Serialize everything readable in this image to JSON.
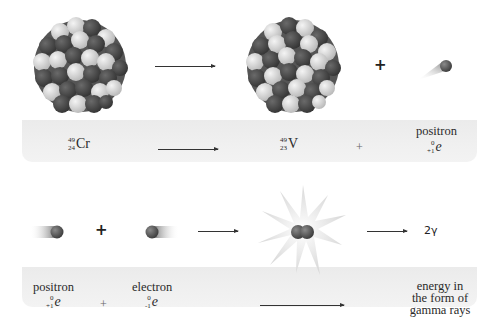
{
  "diagram": {
    "type": "nuclear reaction illustration",
    "rows": [
      {
        "id": "positron-emission",
        "illustration": {
          "reactant": "chromium-49 nucleus (cluster of light and dark nucleons)",
          "arrow": "right-arrow",
          "product": "vanadium-49 nucleus (cluster of light and dark nucleons)",
          "operator": "+",
          "emitted": "positron particle with motion trail"
        },
        "equation": {
          "reactant": {
            "mass": "49",
            "atomic": "24",
            "symbol": "Cr"
          },
          "arrow": "right-arrow",
          "product": {
            "mass": "49",
            "atomic": "23",
            "symbol": "V"
          },
          "operator": "+",
          "particle": {
            "name": "positron",
            "mass": "0",
            "charge": "+1",
            "symbol": "e"
          }
        }
      },
      {
        "id": "annihilation",
        "illustration": {
          "particle1": "positron with motion trail",
          "operator": "+",
          "particle2": "electron with motion trail",
          "arrow": "right-arrow",
          "event": "annihilation burst (12-point star with two particles)",
          "arrow2": "right-arrow",
          "result": "2γ"
        },
        "equation": {
          "particle1": {
            "name": "positron",
            "mass": "0",
            "charge": "+1",
            "symbol": "e"
          },
          "operator": "+",
          "particle2": {
            "name": "electron",
            "mass": "0",
            "charge": "-1",
            "symbol": "e"
          },
          "arrow": "right-arrow",
          "result_lines": [
            "energy in",
            "the form of",
            "gamma rays"
          ]
        }
      }
    ]
  },
  "colors": {
    "band": "#efefef",
    "nucleon_dark": "#4a4a4a",
    "nucleon_light": "#d8d8d8",
    "text": "#2a2a2a",
    "star": "#e4e4e4"
  }
}
